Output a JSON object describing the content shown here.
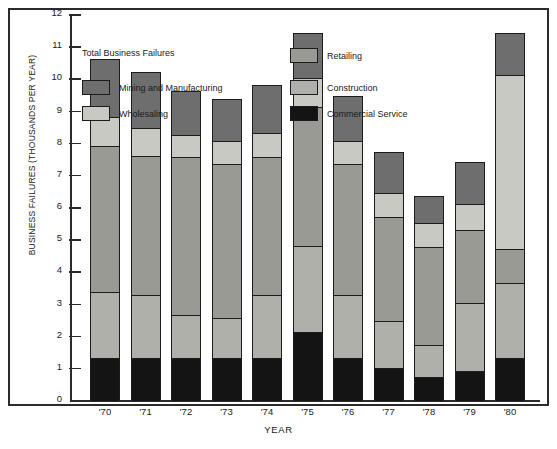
{
  "chart_data": {
    "type": "bar",
    "subtype": "stacked-vertical",
    "title": "Total Business Failures",
    "xlabel": "YEAR",
    "ylabel": "BUSINESS FAILURES (THOUSANDS PER YEAR)",
    "categories": [
      "'70",
      "'71",
      "'72",
      "'73",
      "'74",
      "'75",
      "'76",
      "'77",
      "'78",
      "'79",
      "'80"
    ],
    "ylim": [
      0,
      12
    ],
    "ytick_labels": [
      "0",
      "1",
      "2",
      "3",
      "4",
      "5",
      "6",
      "7",
      "8",
      "9",
      "10",
      "11",
      "12"
    ],
    "grid": false,
    "legend_position": "inside-top",
    "stack_order_bottom_to_top": [
      "Commercial Service",
      "Construction",
      "Retailing",
      "Wholesaling",
      "Mining and Manufacturing"
    ],
    "series": [
      {
        "name": "Commercial Service",
        "key": "commercial",
        "color": "#141414",
        "values": [
          1.3,
          1.3,
          1.3,
          1.3,
          1.3,
          2.1,
          1.3,
          1.0,
          0.7,
          0.9,
          1.3
        ]
      },
      {
        "name": "Construction",
        "key": "construction",
        "color": "#b0b0aa",
        "values": [
          2.05,
          1.95,
          1.35,
          1.25,
          1.95,
          2.7,
          1.95,
          1.45,
          1.0,
          2.1,
          2.35
        ]
      },
      {
        "name": "Retailing",
        "key": "retailing",
        "color": "#9a9a95",
        "values": [
          4.55,
          4.35,
          4.9,
          4.8,
          4.3,
          4.3,
          4.1,
          3.25,
          3.05,
          2.3,
          1.05
        ]
      },
      {
        "name": "Wholesaling",
        "key": "wholesaling",
        "color": "#c9c9c4",
        "values": [
          0.9,
          0.85,
          0.7,
          0.7,
          0.75,
          0.9,
          0.7,
          0.75,
          0.75,
          0.8,
          5.4
        ]
      },
      {
        "name": "Mining and Manufacturing",
        "key": "mining",
        "color": "#6e6e6e",
        "values": [
          1.8,
          1.75,
          1.35,
          1.3,
          1.5,
          1.4,
          1.4,
          1.25,
          0.85,
          1.3,
          1.3
        ]
      }
    ],
    "totals": [
      10.6,
      10.2,
      9.6,
      9.35,
      9.8,
      11.4,
      9.45,
      7.7,
      6.35,
      7.4,
      11.4
    ]
  },
  "legend": {
    "title": "Total Business Failures",
    "items": [
      {
        "label": "Mining and Manufacturing",
        "swatch": "mining"
      },
      {
        "label": "Wholesaling",
        "swatch": "wholesaling"
      },
      {
        "label": "Retailing",
        "swatch": "retailing"
      },
      {
        "label": "Construction",
        "swatch": "construction"
      },
      {
        "label": "Commercial Service",
        "swatch": "commercial"
      }
    ]
  }
}
